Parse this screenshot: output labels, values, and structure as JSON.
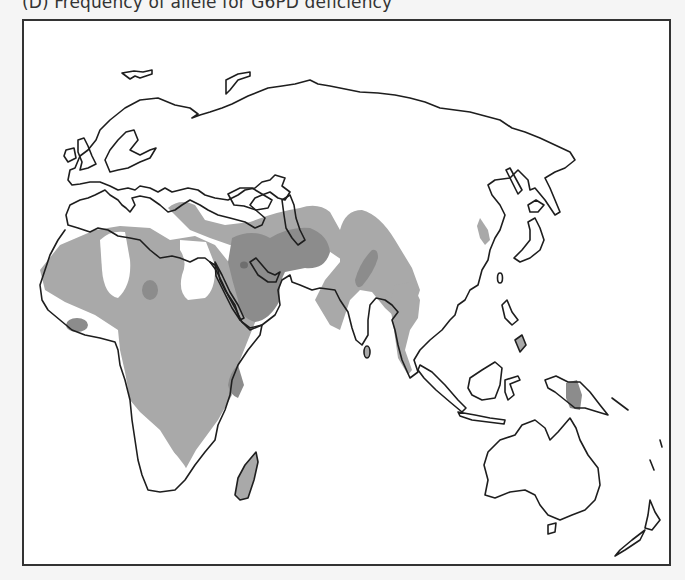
{
  "figure": {
    "title": "(D) Frequency of allele for G6PD deficiency",
    "panel_label": "D"
  },
  "map": {
    "subject": "G6PD deficiency allele frequency",
    "regions_shown": [
      "Europe",
      "Africa",
      "Middle East",
      "Asia",
      "Southeast Asia",
      "Australia",
      "New Zealand"
    ],
    "legend": "not shown",
    "shading_levels": [
      {
        "level": "low",
        "color": "#a9a9a9",
        "description": "light gray shading"
      },
      {
        "level": "medium",
        "color": "#8c8c8c",
        "description": "medium gray shading"
      },
      {
        "level": "high",
        "color": "#6e6e6e",
        "description": "dark gray spots"
      }
    ],
    "shaded_areas": [
      {
        "name": "Sub-Saharan & North Africa",
        "level": "low"
      },
      {
        "name": "Mediterranean / Anatolia band",
        "level": "low"
      },
      {
        "name": "Arabia, Iran, Iraq",
        "level": "medium"
      },
      {
        "name": "Central Arabia spot",
        "level": "high"
      },
      {
        "name": "West Africa spot",
        "level": "medium"
      },
      {
        "name": "Sahel spot",
        "level": "medium"
      },
      {
        "name": "East Africa coast spot",
        "level": "medium"
      },
      {
        "name": "Madagascar",
        "level": "low"
      },
      {
        "name": "Central & South Asia band",
        "level": "low"
      },
      {
        "name": "North India streak",
        "level": "medium"
      },
      {
        "name": "Indochina & Malay Peninsula",
        "level": "low"
      },
      {
        "name": "Korea",
        "level": "low"
      },
      {
        "name": "Philippines (Mindanao)",
        "level": "low"
      },
      {
        "name": "New Guinea",
        "level": "medium"
      },
      {
        "name": "Sri Lanka",
        "level": "low"
      }
    ],
    "colors": {
      "background_outside": "#f5f5f5",
      "map_background": "#ffffff",
      "frame": "#333333",
      "coastline": "#1e1e1e"
    }
  }
}
